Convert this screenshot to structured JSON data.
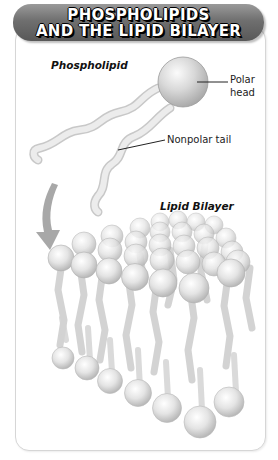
{
  "title": {
    "line1": "PHOSPHOLIPIDS",
    "line2": "AND THE LIPID BILAYER"
  },
  "labels": {
    "phospholipid": "Phospholipid",
    "polar_head_line1": "Polar",
    "polar_head_line2": "head",
    "nonpolar_tail": "Nonpolar tail",
    "lipid_bilayer": "Lipid Bilayer"
  },
  "colors": {
    "banner": "#6f6f6f",
    "banner_text": "#ffffff",
    "card_border": "#d6d6d6",
    "sphere": "#e8e8e8",
    "tail": "#d9d9d9",
    "arrow": "#a8a8a8"
  }
}
